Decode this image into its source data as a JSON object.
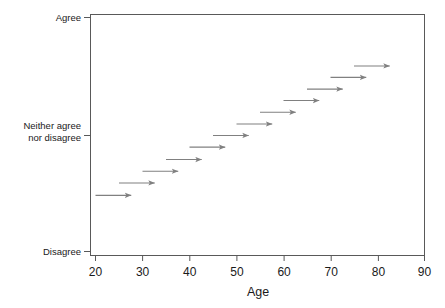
{
  "chart_data": {
    "type": "scatter",
    "title": "",
    "subtitle": "",
    "xlabel": "Age",
    "ylabel": "",
    "xlim": [
      20,
      90
    ],
    "ylim": [
      0,
      100
    ],
    "grid": false,
    "legend": null,
    "x_ticks": [
      20,
      30,
      40,
      50,
      60,
      70,
      80,
      90
    ],
    "x_tick_labels": [
      "20",
      "30",
      "40",
      "50",
      "60",
      "70",
      "80",
      "90"
    ],
    "y_ticks": [
      100,
      50,
      0
    ],
    "y_tick_labels": [
      "Agree",
      "Neither agree\nnor disagree",
      "Disagree"
    ],
    "y_tick_labels_lines": [
      [
        "Agree"
      ],
      [
        "Neither agree",
        "nor disagree"
      ],
      [
        "Disagree"
      ]
    ],
    "marker": "arrow",
    "marker_color": "#808080",
    "annotations": [],
    "series": [
      {
        "name": "Age trajectory arrows",
        "type": "arrow",
        "color": "#808080",
        "arrows": [
          {
            "x_start": 20.0,
            "x_end": 27.6,
            "y": 24.0
          },
          {
            "x_start": 25.0,
            "x_end": 32.6,
            "y": 29.3
          },
          {
            "x_start": 30.0,
            "x_end": 37.6,
            "y": 34.3
          },
          {
            "x_start": 35.0,
            "x_end": 42.6,
            "y": 39.3
          },
          {
            "x_start": 40.0,
            "x_end": 47.6,
            "y": 44.6
          },
          {
            "x_start": 45.0,
            "x_end": 52.6,
            "y": 49.6
          },
          {
            "x_start": 50.0,
            "x_end": 57.6,
            "y": 54.5
          },
          {
            "x_start": 55.0,
            "x_end": 62.6,
            "y": 59.5
          },
          {
            "x_start": 60.0,
            "x_end": 67.6,
            "y": 64.5
          },
          {
            "x_start": 65.0,
            "x_end": 72.6,
            "y": 69.4
          },
          {
            "x_start": 70.0,
            "x_end": 77.6,
            "y": 74.4
          },
          {
            "x_start": 75.0,
            "x_end": 82.6,
            "y": 79.3
          }
        ]
      }
    ]
  },
  "axes": {
    "x_axis_title": "Age",
    "x_tick_labels": [
      "20",
      "30",
      "40",
      "50",
      "60",
      "70",
      "80",
      "90"
    ],
    "y_tick_label_top": "Agree",
    "y_tick_label_mid_line1": "Neither agree",
    "y_tick_label_mid_line2": "nor disagree",
    "y_tick_label_bottom": "Disagree"
  },
  "colors": {
    "arrow": "#808080",
    "frame": "#595959",
    "text": "#1a1a1a",
    "background": "#ffffff"
  }
}
